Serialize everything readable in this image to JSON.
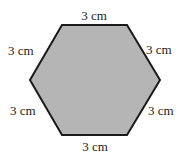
{
  "figure": {
    "shape": "regular hexagon",
    "fill_color": "#b5b5b5",
    "stroke_color": "#1a1a1a",
    "side_labels": {
      "top": "3 cm",
      "upper_left": "3 cm",
      "upper_right": "3 cm",
      "lower_left": "3 cm",
      "lower_right": "3 cm",
      "bottom": "3 cm"
    }
  }
}
